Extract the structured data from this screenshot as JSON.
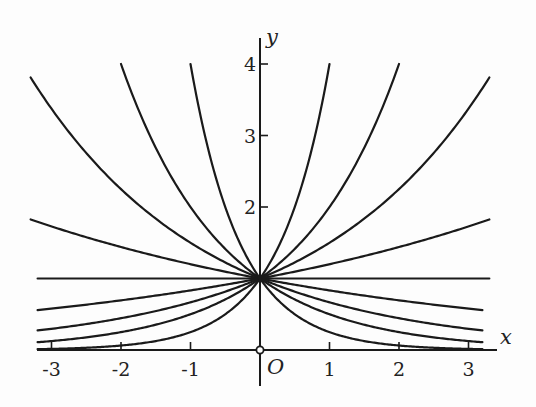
{
  "chart_data": {
    "type": "line",
    "title": "",
    "xlabel": "x",
    "ylabel": "y",
    "origin_label": "O",
    "xlim": [
      -3.2,
      3.4
    ],
    "ylim": [
      0,
      4.3
    ],
    "x_ticks": [
      -3,
      -2,
      -1,
      1,
      2,
      3
    ],
    "x_tick_labels": [
      "-3",
      "-2",
      "-1",
      "1",
      "2",
      "3"
    ],
    "y_ticks": [
      2,
      3,
      4
    ],
    "y_tick_labels": [
      "2",
      "3",
      "4"
    ],
    "grid": false,
    "legend": "none",
    "series": [
      {
        "name": "y = 4^x",
        "base": 4,
        "x_range": [
          -3.2,
          1.0
        ]
      },
      {
        "name": "y = 2^x",
        "base": 2,
        "x_range": [
          -3.2,
          2.0
        ]
      },
      {
        "name": "y = 1.5^x",
        "base": 1.5,
        "x_range": [
          -3.2,
          3.3
        ]
      },
      {
        "name": "y = 1.2^x",
        "base": 1.2,
        "x_range": [
          -3.2,
          3.3
        ]
      },
      {
        "name": "y = 1",
        "base": 1,
        "x_range": [
          -3.2,
          3.3
        ]
      },
      {
        "name": "y = (1/1.2)^x",
        "base": 0.8333,
        "x_range": [
          -3.3,
          3.2
        ]
      },
      {
        "name": "y = (1/1.5)^x",
        "base": 0.6667,
        "x_range": [
          -3.3,
          3.2
        ]
      },
      {
        "name": "y = (1/2)^x",
        "base": 0.5,
        "x_range": [
          -2.0,
          3.2
        ]
      },
      {
        "name": "y = (1/4)^x",
        "base": 0.25,
        "x_range": [
          -1.0,
          3.2
        ]
      }
    ]
  }
}
